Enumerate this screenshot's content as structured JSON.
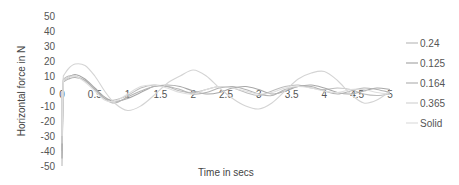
{
  "chart_data": {
    "type": "line",
    "title": "",
    "xlabel": "Time in secs",
    "ylabel": "Horizontal force in N",
    "xlim": [
      0,
      5
    ],
    "ylim": [
      -50,
      50
    ],
    "x_ticks": [
      "0",
      "0.5",
      "1",
      "1.5",
      "2",
      "2.5",
      "3",
      "3.5",
      "4",
      "4.5",
      "5"
    ],
    "y_ticks": [
      "50",
      "40",
      "30",
      "20",
      "10",
      "0",
      "-10",
      "-20",
      "-30",
      "-40",
      "-50"
    ],
    "grid": false,
    "legend_position": "right",
    "x": [
      0,
      0.02,
      0.1,
      0.2,
      0.35,
      0.5,
      0.65,
      0.8,
      1.0,
      1.2,
      1.4,
      1.6,
      1.8,
      2.0,
      2.2,
      2.4,
      2.6,
      2.8,
      3.0,
      3.2,
      3.4,
      3.6,
      3.8,
      4.0,
      4.2,
      4.4,
      4.6,
      4.8,
      5.0
    ],
    "series": [
      {
        "name": "0.24",
        "color": "#bdbdbd",
        "values": [
          -50,
          8,
          10,
          10,
          7,
          1,
          -5,
          -6,
          -3,
          2,
          4,
          3,
          0,
          -1,
          1,
          3,
          2,
          -1,
          -3,
          0,
          3,
          4,
          2,
          1,
          2,
          1,
          -2,
          -3,
          -2
        ]
      },
      {
        "name": "0.125",
        "color": "#a8a8a8",
        "values": [
          -45,
          7,
          9,
          11,
          8,
          2,
          -4,
          -7,
          -5,
          -1,
          3,
          4,
          3,
          0,
          -2,
          -1,
          2,
          3,
          1,
          -2,
          0,
          3,
          4,
          2,
          -1,
          -2,
          0,
          2,
          1
        ]
      },
      {
        "name": "0.164",
        "color": "#b4b4b4",
        "values": [
          -40,
          6,
          8,
          9,
          7,
          1,
          -5,
          -8,
          -4,
          0,
          3,
          3,
          1,
          -2,
          -1,
          2,
          3,
          1,
          -2,
          -3,
          1,
          3,
          3,
          0,
          -2,
          0,
          2,
          1,
          -1
        ]
      },
      {
        "name": "0.365",
        "color": "#d4d4d4",
        "values": [
          -35,
          10,
          15,
          18,
          17,
          10,
          0,
          -8,
          -13,
          -10,
          -3,
          5,
          10,
          14,
          10,
          2,
          -5,
          -10,
          -12,
          -8,
          0,
          8,
          12,
          13,
          7,
          -2,
          -8,
          -6,
          0
        ]
      },
      {
        "name": "Solid",
        "color": "#dedede",
        "values": [
          -30,
          7,
          9,
          10,
          6,
          0,
          -6,
          -7,
          -2,
          3,
          4,
          2,
          -1,
          -2,
          1,
          3,
          2,
          0,
          -2,
          -1,
          2,
          3,
          2,
          0,
          -1,
          1,
          1,
          -1,
          -2
        ]
      }
    ]
  }
}
